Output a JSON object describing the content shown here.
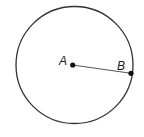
{
  "diagram": {
    "type": "circle-radius",
    "circle": {
      "cx": 74.5,
      "cy": 65,
      "r": 58.5,
      "stroke": "#333333"
    },
    "points": [
      {
        "label": "A",
        "x": 72.7,
        "y": 65,
        "label_x": 59,
        "label_y": 65
      },
      {
        "label": "B",
        "x": 131,
        "y": 73.3,
        "label_x": 117,
        "label_y": 70
      }
    ],
    "segment": {
      "from": "A",
      "to": "B",
      "stroke": "#555555"
    }
  }
}
